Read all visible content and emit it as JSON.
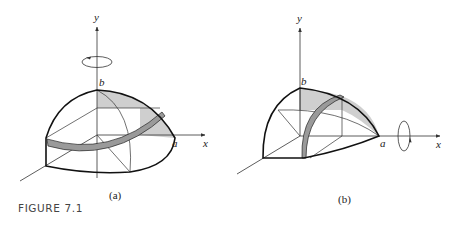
{
  "figure": {
    "label": "FIGURE 7.1",
    "panels": [
      {
        "id": "a",
        "caption": "(a)",
        "axis_labels": {
          "y": "y",
          "x": "x"
        },
        "point_labels": {
          "top": "b",
          "right": "a"
        },
        "rotation_axis": "y",
        "description": "Quarter ellipsoid of revolution about the y-axis with a shaded horizontal ring slice"
      },
      {
        "id": "b",
        "caption": "(b)",
        "axis_labels": {
          "y": "y",
          "x": "x"
        },
        "point_labels": {
          "top": "b",
          "right": "a"
        },
        "rotation_axis": "x",
        "description": "Quarter ellipsoid of revolution about the x-axis with a shaded vertical ring slice"
      }
    ],
    "colors": {
      "stroke": "#111111",
      "shade": "#c8c8c8",
      "ring": "#9a9a9a",
      "axis": "#333333"
    }
  }
}
